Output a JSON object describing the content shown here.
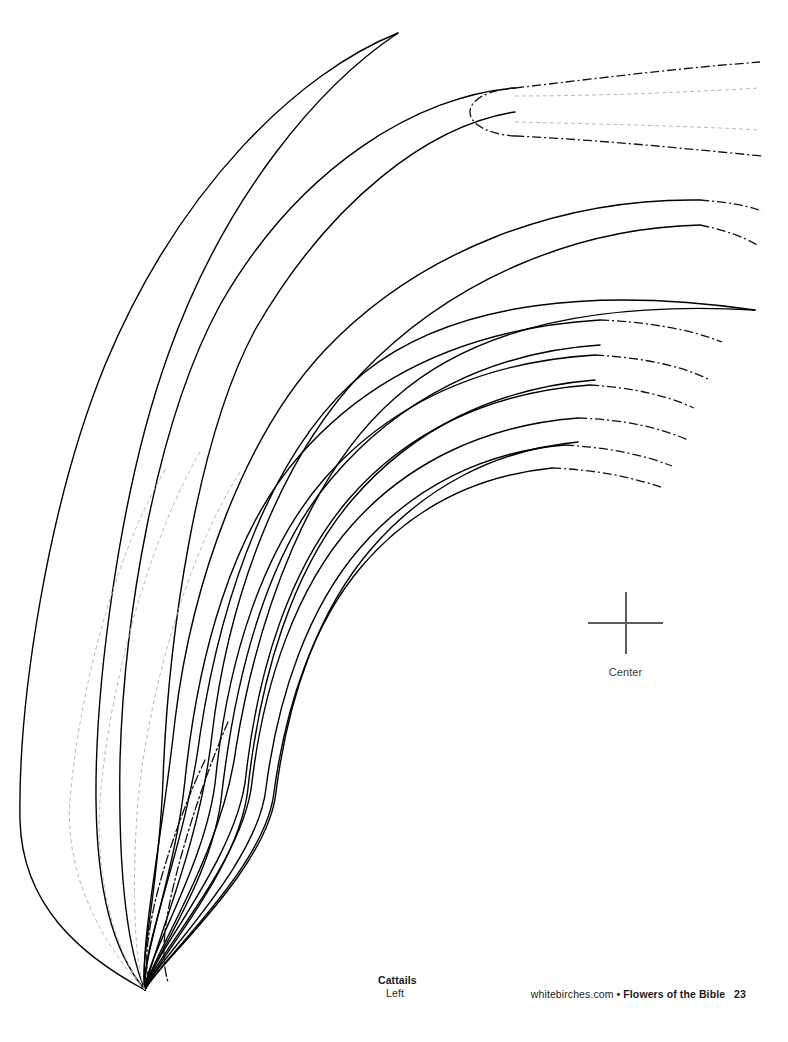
{
  "page": {
    "width": 788,
    "height": 1042,
    "background": "#ffffff",
    "kind": "printable-pattern-page"
  },
  "registration": {
    "crosshair_icon": "crosshair-icon",
    "label": "Center",
    "color": "#5d5d5d",
    "x": 625,
    "y": 623
  },
  "footer": {
    "left": {
      "title": "Cattails",
      "subtitle": "Left"
    },
    "right": {
      "site": "whitebirches.com",
      "separator": "•",
      "book": "Flowers of the Bible",
      "page_number": "23"
    }
  },
  "artwork": {
    "title": "Cattails Left",
    "description": "Long curving cattail leaf outlines converging at a single base point near the lower left, with leaf tips fanning up and to the right.",
    "solid_stroke": "#000000",
    "solid_stroke_width": 1.4,
    "dashdot_stroke": "#111111",
    "dashdot_stroke_width": 1.3,
    "dashdot_pattern": "9 3 2 3",
    "guide_stroke": "#b9b9b9",
    "guide_stroke_width": 1,
    "guide_pattern": "4 3",
    "base_point": [
      145,
      990
    ],
    "leaves": [
      {
        "name": "leaf-1-outer-long",
        "tip": [
          398,
          33
        ],
        "note": "longest leaf, pointed tip upper area, sweeps far left",
        "edge_a": "M398,33 C300,72 180,185 105,365 C48,505 18,700 20,820 C22,905 80,955 145,990",
        "edge_b": "M398,33 C320,85 225,195 168,355 C118,495 95,690 96,800 C97,890 112,950 145,990"
      },
      {
        "name": "leaf-2-dashdot-tip",
        "tip": [
          515,
          88
        ],
        "note": "ends at dash-dot page-break boundary",
        "edge_a": "M515,88 C420,95 300,165 220,305 C155,425 124,620 120,760 C118,880 128,950 145,990",
        "edge_b": "M515,112 C430,125 330,200 255,330 C196,440 168,640 163,780 C159,890 139,960 145,990",
        "dashdot_cap": "M515,88 C487,90 470,100 470,112 C470,124 487,134 515,136",
        "dashdot_ext_a": "M515,88 C600,78 680,68 760,62",
        "dashdot_ext_b": "M515,136 C600,140 680,148 762,156"
      },
      {
        "name": "leaf-3",
        "tip": [
          755,
          207
        ],
        "edge_a": "M700,200 C560,198 420,250 325,350 C245,435 192,580 175,720 C162,840 140,940 145,990",
        "edge_b": "M700,225 C575,228 450,280 360,375 C278,462 228,600 212,735 C200,845 152,950 145,990",
        "dashdot_ext_a": "M700,200 C726,202 745,205 762,211",
        "dashdot_ext_b": "M700,225 C724,230 742,236 757,245"
      },
      {
        "name": "leaf-4-long-point",
        "tip": [
          755,
          310
        ],
        "edge_a": "M755,310 C600,288 455,300 365,372 C275,444 222,590 200,735 C186,845 140,950 145,990",
        "edge_b": "M755,310 C610,302 480,322 395,398 C310,472 258,612 236,748 C222,855 150,958 145,990"
      },
      {
        "name": "leaf-5",
        "tip": [
          720,
          335
        ],
        "edge_a": "M600,320 C470,328 370,375 300,455 C232,532 198,655 185,780 C176,870 142,955 145,990",
        "edge_b": "M600,345 C490,352 398,400 332,478 C268,552 236,672 222,792 C214,878 150,962 145,990",
        "dashdot_ext": "M600,320 C650,322 692,330 722,342"
      },
      {
        "name": "leaf-6",
        "tip": [
          705,
          375
        ],
        "edge_a": "M595,355 C480,362 390,405 325,478 C262,550 228,660 216,775 C208,862 145,958 145,990",
        "edge_b": "M595,380 C494,388 412,430 352,500 C292,570 260,678 248,788 C240,870 152,965 145,990",
        "dashdot_ext": "M595,355 C645,358 682,366 710,380"
      },
      {
        "name": "leaf-7",
        "tip": [
          690,
          400
        ],
        "edge_a": "M590,385 C490,392 406,432 348,500 C290,568 258,668 246,775 C238,858 148,960 145,990",
        "dashdot_ext": "M590,385 C636,388 668,396 694,408"
      },
      {
        "name": "leaf-8",
        "tip": [
          685,
          435
        ],
        "edge_a": "M578,418 C486,425 408,462 352,525 C296,588 264,682 252,782 C244,862 150,962 145,990",
        "edge_b": "M578,442 C494,450 424,488 372,548 C318,610 288,698 276,792 C268,870 155,966 145,990",
        "dashdot_ext": "M578,418 C628,420 660,428 688,440"
      },
      {
        "name": "leaf-9",
        "tip": [
          670,
          460
        ],
        "edge_a": "M565,445 C482,452 412,488 360,548 C308,608 278,696 266,788 C258,866 152,965 145,990",
        "dashdot_ext": "M565,445 C614,448 646,456 672,466"
      },
      {
        "name": "leaf-10",
        "tip": [
          662,
          482
        ],
        "edge_a": "M552,468 C474,476 410,510 362,566 C314,622 286,704 274,792 C266,868 154,966 145,990",
        "dashdot_ext": "M552,468 C600,470 634,478 664,488"
      },
      {
        "name": "leaf-11-inner-dashdot",
        "note": "thin dash-dot leaf near lower middle",
        "edge_a": "M228,722 C208,768 186,832 172,892 C162,936 162,962 168,982",
        "edge_b": "M205,760 C186,800 166,856 155,902 C147,938 145,962 148,978"
      }
    ],
    "guides": [
      {
        "name": "guide-centerline-1",
        "path": "M165,470 C112,560 78,700 70,800 C63,888 118,962 145,990"
      },
      {
        "name": "guide-centerline-2",
        "path": "M200,452 C146,545 108,695 100,800 C94,890 122,965 145,990"
      },
      {
        "name": "guide-centerline-3",
        "path": "M240,472 C184,560 148,700 138,800 C131,890 135,968 145,990"
      },
      {
        "name": "guide-tip-line-a",
        "path": "M515,96 C600,96 690,92 760,88"
      },
      {
        "name": "guide-tip-line-b",
        "path": "M515,122 C600,124 690,126 760,130"
      }
    ]
  }
}
